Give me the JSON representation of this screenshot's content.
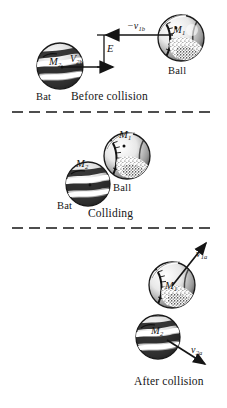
{
  "figure": {
    "background_color": "#ffffff",
    "ink_color": "#151515",
    "width": 227,
    "height": 408
  },
  "panels": [
    {
      "id": "before",
      "caption": "Before collision",
      "objects": [
        {
          "id": "bat-before",
          "name": "Bat",
          "mass_label": "M",
          "mass_subscript": "2",
          "type": "bat"
        },
        {
          "id": "ball-before",
          "name": "Ball",
          "mass_label": "M",
          "mass_subscript": "1",
          "type": "ball"
        }
      ],
      "vectors": [
        {
          "id": "v-bat-before",
          "symbol": "V",
          "subscript": "2b",
          "sign": "",
          "direction": "right"
        },
        {
          "id": "v-ball-before",
          "symbol": "v",
          "subscript": "1b",
          "sign": "−",
          "direction": "left"
        }
      ],
      "annotations": [
        {
          "id": "offset-E",
          "label": "E",
          "kind": "offset-bracket"
        }
      ]
    },
    {
      "id": "colliding",
      "caption": "Colliding",
      "objects": [
        {
          "id": "bat-colliding",
          "name": "Bat",
          "mass_label": "M",
          "mass_subscript": "2",
          "type": "bat"
        },
        {
          "id": "ball-colliding",
          "name": "Ball",
          "mass_label": "M",
          "mass_subscript": "1",
          "type": "ball"
        }
      ],
      "vectors": [],
      "annotations": []
    },
    {
      "id": "after",
      "caption": "After collision",
      "objects": [
        {
          "id": "ball-after",
          "name": "",
          "mass_label": "M",
          "mass_subscript": "1",
          "type": "ball"
        },
        {
          "id": "bat-after",
          "name": "",
          "mass_label": "M",
          "mass_subscript": "2",
          "type": "bat"
        }
      ],
      "vectors": [
        {
          "id": "v-ball-after",
          "symbol": "v",
          "subscript": "1a",
          "sign": "",
          "direction": "up-right"
        },
        {
          "id": "v-bat-after",
          "symbol": "v",
          "subscript": "2a",
          "sign": "",
          "direction": "down-right"
        }
      ],
      "annotations": []
    }
  ],
  "separators": [
    {
      "id": "separator-1",
      "style": "dashed"
    },
    {
      "id": "separator-2",
      "style": "dashed"
    }
  ]
}
